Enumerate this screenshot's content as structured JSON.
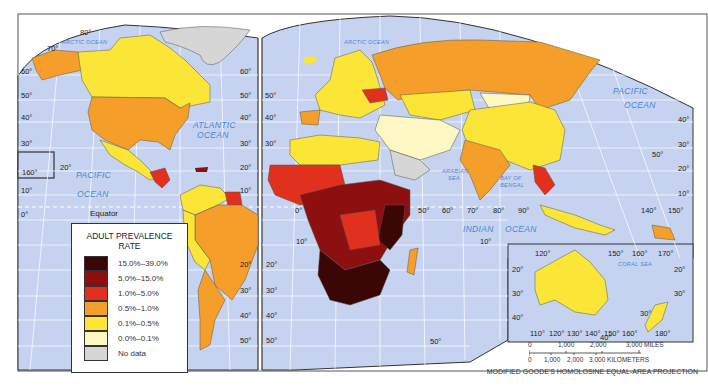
{
  "legend": {
    "title_line1": "ADULT PREVALENCE",
    "title_line2": "RATE",
    "items": [
      {
        "label": "15.0%–39.0%",
        "color": "#3a0606"
      },
      {
        "label": "5.0%–15.0%",
        "color": "#8e0f0f"
      },
      {
        "label": "1.0%–5.0%",
        "color": "#e2301e"
      },
      {
        "label": "0.5%–1.0%",
        "color": "#f59e2a"
      },
      {
        "label": "0.1%–0.5%",
        "color": "#fbe638"
      },
      {
        "label": "0.0%–0.1%",
        "color": "#fdf7c4"
      },
      {
        "label": "No data",
        "color": "#d6d6d6"
      }
    ]
  },
  "colors": {
    "ocean": "#c5d3f0",
    "grid": "#ffffff",
    "border": "#333333"
  },
  "ocean_labels": {
    "arctic_west": "ARCTIC OCEAN",
    "arctic_east": "ARCTIC OCEAN",
    "atlantic_1": "ATLANTIC",
    "atlantic_2": "OCEAN",
    "pacific_w1": "PACIFIC",
    "pacific_w2": "OCEAN",
    "pacific_e1": "PACIFIC",
    "pacific_e2": "OCEAN",
    "indian_1": "INDIAN",
    "indian_2": "OCEAN",
    "arabian_1": "ARABIAN",
    "arabian_2": "SEA",
    "bengal_1": "BAY OF",
    "bengal_2": "BENGAL",
    "coral": "CORAL   SEA"
  },
  "equator_label": "Equator",
  "latitude_labels": {
    "l80": "80°",
    "l70": "70°",
    "l60": "60°",
    "l50": "50°",
    "l40": "40°",
    "l30": "30°",
    "l20": "20°",
    "l10": "10°",
    "l0": "0°"
  },
  "longitude_labels": {
    "e0": "0°",
    "e50": "50°",
    "e60": "60°",
    "e70": "70°",
    "e80": "80°",
    "e90": "90°",
    "e140": "140°",
    "e150": "150°",
    "w160": "160°"
  },
  "australia_inset": {
    "top": [
      "120°",
      "150°",
      "160°",
      "170°"
    ],
    "bottom": [
      "110°",
      "120°",
      "130°",
      "140°",
      "150°",
      "160°",
      "180°"
    ],
    "left": [
      "20°",
      "30°",
      "40°"
    ],
    "right": [
      "20°",
      "30°"
    ]
  },
  "scale": {
    "miles": [
      "0",
      "1,000",
      "2,000",
      "3,000 MILES"
    ],
    "km": [
      "0",
      "1,000",
      "2,000",
      "3,000 KILOMETERS"
    ]
  },
  "projection": "MODIFIED GOODE'S HOMOLOSINE EQUAL-AREA PROJECTION"
}
